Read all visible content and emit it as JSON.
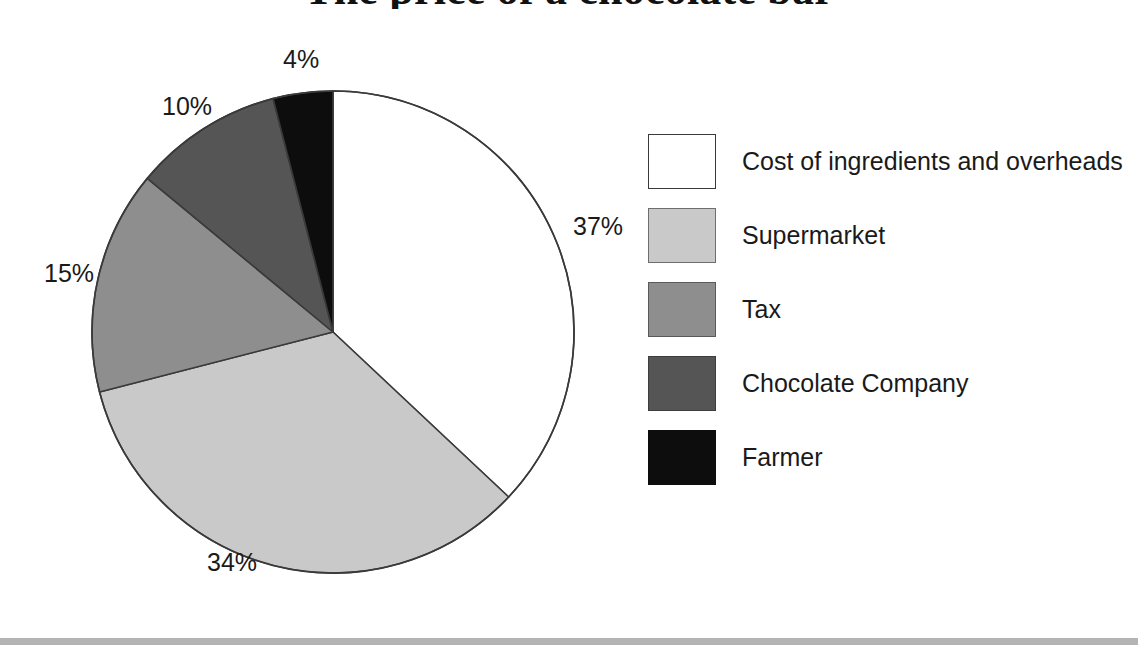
{
  "title": {
    "text": "The price of a chocolate bar",
    "visible": "partially cut off at top edge"
  },
  "chart_data": {
    "type": "pie",
    "title": "The price of a chocolate bar",
    "xlabel": "",
    "ylabel": "",
    "legend_position": "right",
    "grid": false,
    "start_angle_clock": "12 o'clock",
    "direction": "clockwise",
    "categories": [
      "Cost of ingredients and overheads",
      "Supermarket",
      "Tax",
      "Chocolate Company",
      "Farmer"
    ],
    "values": [
      37,
      34,
      15,
      10,
      4
    ],
    "value_labels": [
      "37%",
      "34%",
      "15%",
      "10%",
      "4%"
    ],
    "colors": [
      "#ffffff",
      "#c9c9c9",
      "#8e8e8e",
      "#555555",
      "#0d0d0d"
    ],
    "units": "percent",
    "total": 100
  },
  "slices": [
    {
      "label": "Cost of ingredients and overheads",
      "value": 37,
      "value_label": "37%",
      "color": "#ffffff",
      "stroke": "#3a3a3a"
    },
    {
      "label": "Supermarket",
      "value": 34,
      "value_label": "34%",
      "color": "#c9c9c9",
      "stroke": "#3a3a3a"
    },
    {
      "label": "Tax",
      "value": 15,
      "value_label": "15%",
      "color": "#8e8e8e",
      "stroke": "#3a3a3a"
    },
    {
      "label": "Chocolate Company",
      "value": 10,
      "value_label": "10%",
      "color": "#555555",
      "stroke": "#3a3a3a"
    },
    {
      "label": "Farmer",
      "value": 4,
      "value_label": "4%",
      "color": "#0d0d0d",
      "stroke": "#3a3a3a"
    }
  ],
  "legend": {
    "items": [
      {
        "label": "Cost of ingredients and overheads",
        "color": "#ffffff",
        "border": "#3a3a3a"
      },
      {
        "label": "Supermarket",
        "color": "#c9c9c9",
        "border": "#6e6e6e"
      },
      {
        "label": "Tax",
        "color": "#8e8e8e",
        "border": "#5a5a5a"
      },
      {
        "label": "Chocolate Company",
        "color": "#555555",
        "border": "#3d3d3d"
      },
      {
        "label": "Farmer",
        "color": "#0d0d0d",
        "border": "#0d0d0d"
      }
    ]
  }
}
